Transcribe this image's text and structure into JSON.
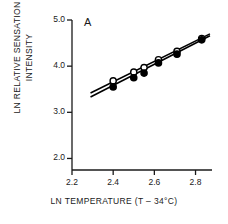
{
  "figure": {
    "panel_label": "A",
    "x_axis_title": "LN TEMPERATURE (T – 34°C)",
    "y_axis_title_line1": "LN RELATIVE SENSATION",
    "y_axis_title_line2": "INTENSITY"
  },
  "chart_data": {
    "type": "scatter",
    "title": "A",
    "xlabel": "LN TEMPERATURE (T – 34°C)",
    "ylabel": "LN RELATIVE SENSATION INTENSITY",
    "xlim": [
      2.2,
      2.88
    ],
    "ylim": [
      1.75,
      5.0
    ],
    "xticks": [
      2.2,
      2.4,
      2.6,
      2.8
    ],
    "xtick_labels": [
      "2.2",
      "2.4",
      "2.6",
      "2.8"
    ],
    "yticks": [
      2.0,
      3.0,
      4.0,
      5.0
    ],
    "ytick_labels": [
      "2.0",
      "3.0",
      "4.0",
      "5.0"
    ],
    "grid": false,
    "legend": "none",
    "series": [
      {
        "name": "open-circles",
        "marker": "open-circle",
        "color": "#000000",
        "fill": "#ffffff",
        "x": [
          2.4,
          2.5,
          2.55,
          2.62,
          2.71,
          2.83
        ],
        "y": [
          3.68,
          3.87,
          3.97,
          4.14,
          4.32,
          4.6
        ]
      },
      {
        "name": "filled-circles",
        "marker": "filled-circle",
        "color": "#000000",
        "fill": "#000000",
        "x": [
          2.4,
          2.5,
          2.55,
          2.62,
          2.71,
          2.83
        ],
        "y": [
          3.55,
          3.75,
          3.85,
          4.07,
          4.26,
          4.57
        ]
      }
    ],
    "fit_lines": [
      {
        "name": "upper-regression-line",
        "for_series": "open-circles",
        "x": [
          2.29,
          2.87
        ],
        "y": [
          3.42,
          4.7
        ]
      },
      {
        "name": "lower-regression-line",
        "for_series": "filled-circles",
        "x": [
          2.29,
          2.87
        ],
        "y": [
          3.33,
          4.66
        ]
      }
    ]
  }
}
